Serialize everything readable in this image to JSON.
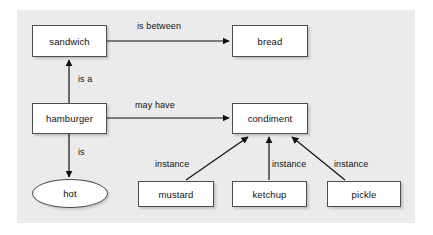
{
  "diagram": {
    "background_color": "#ebebeb",
    "page_color": "#ffffff",
    "node_fill": "#ffffff",
    "node_stroke": "#4d4d4d",
    "text_color": "#111111",
    "nodes": [
      {
        "id": "sandwich",
        "label": "sandwich",
        "shape": "rect",
        "x": 32,
        "y": 25,
        "w": 75,
        "h": 32
      },
      {
        "id": "bread",
        "label": "bread",
        "shape": "rect",
        "x": 232,
        "y": 25,
        "w": 76,
        "h": 32
      },
      {
        "id": "hamburger",
        "label": "hamburger",
        "shape": "rect",
        "x": 32,
        "y": 103,
        "w": 75,
        "h": 31
      },
      {
        "id": "condiment",
        "label": "condiment",
        "shape": "rect",
        "x": 232,
        "y": 103,
        "w": 76,
        "h": 31
      },
      {
        "id": "hot",
        "label": "hot",
        "shape": "ellipse",
        "x": 32,
        "y": 179,
        "w": 76,
        "h": 29
      },
      {
        "id": "mustard",
        "label": "mustard",
        "shape": "rect",
        "x": 138,
        "y": 181,
        "w": 76,
        "h": 26
      },
      {
        "id": "ketchup",
        "label": "ketchup",
        "shape": "rect",
        "x": 232,
        "y": 181,
        "w": 75,
        "h": 26
      },
      {
        "id": "pickle",
        "label": "pickle",
        "shape": "rect",
        "x": 327,
        "y": 181,
        "w": 74,
        "h": 26
      }
    ],
    "edges": [
      {
        "id": "sandwich-bread",
        "from": "sandwich",
        "to": "bread",
        "label": "is between",
        "label_x": 137,
        "label_y": 21
      },
      {
        "id": "hamburger-sandwich",
        "from": "hamburger",
        "to": "sandwich",
        "label": "is a",
        "label_x": 78,
        "label_y": 74
      },
      {
        "id": "hamburger-condiment",
        "from": "hamburger",
        "to": "condiment",
        "label": "may have",
        "label_x": 135,
        "label_y": 100
      },
      {
        "id": "hamburger-hot",
        "from": "hamburger",
        "to": "hot",
        "label": "is",
        "label_x": 78,
        "label_y": 147
      },
      {
        "id": "mustard-condiment",
        "from": "mustard",
        "to": "condiment",
        "label": "instance",
        "label_x": 155,
        "label_y": 159
      },
      {
        "id": "ketchup-condiment",
        "from": "ketchup",
        "to": "condiment",
        "label": "instance",
        "label_x": 272,
        "label_y": 159
      },
      {
        "id": "pickle-condiment",
        "from": "pickle",
        "to": "condiment",
        "label": "instance",
        "label_x": 334,
        "label_y": 159
      }
    ]
  }
}
